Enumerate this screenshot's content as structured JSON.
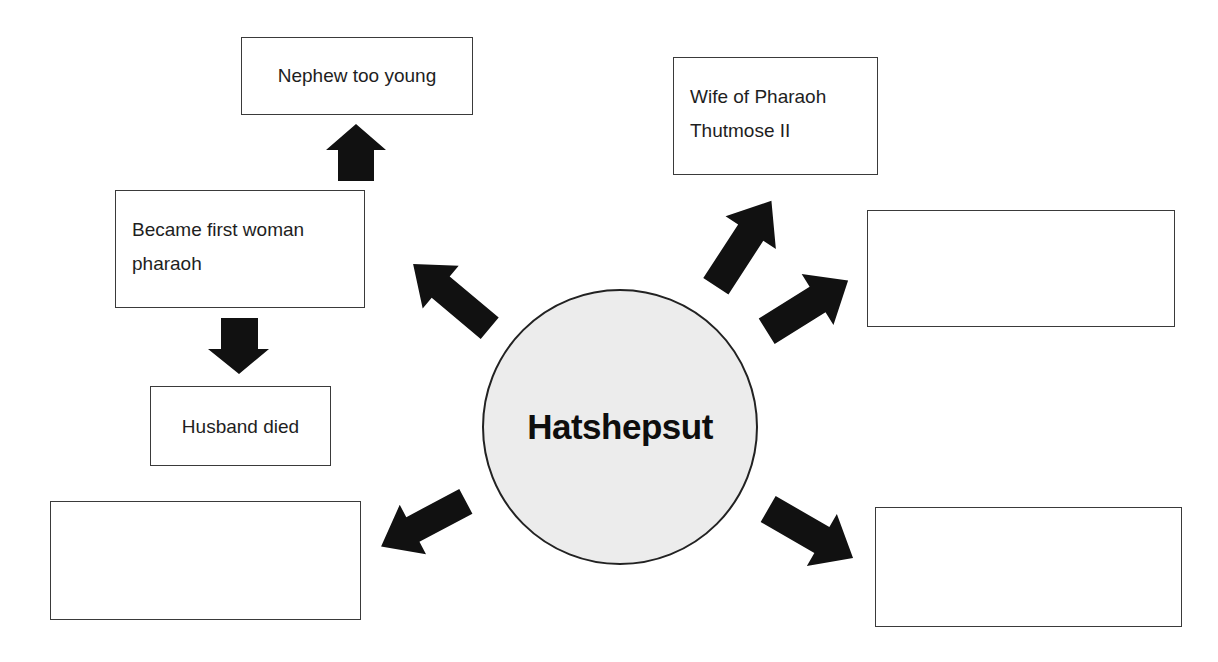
{
  "diagram": {
    "type": "concept-web",
    "center": {
      "label": "Hatshepsut"
    },
    "boxes": [
      {
        "id": "nephew",
        "text": "Nephew too young"
      },
      {
        "id": "first-woman",
        "text": "Became first woman\npharaoh"
      },
      {
        "id": "husband",
        "text": "Husband died"
      },
      {
        "id": "bottom-left",
        "text": ""
      },
      {
        "id": "wife",
        "text": "Wife of Pharaoh\nThutmose II"
      },
      {
        "id": "right",
        "text": ""
      },
      {
        "id": "bottom-right",
        "text": ""
      }
    ],
    "arrows": [
      {
        "from": "center",
        "to": "first-woman",
        "icon": "arrow-up-left-icon"
      },
      {
        "from": "first-woman",
        "to": "nephew",
        "icon": "arrow-up-icon"
      },
      {
        "from": "first-woman",
        "to": "husband",
        "icon": "arrow-down-icon"
      },
      {
        "from": "center",
        "to": "bottom-left",
        "icon": "arrow-down-left-icon"
      },
      {
        "from": "center",
        "to": "wife",
        "icon": "arrow-up-right-icon"
      },
      {
        "from": "center",
        "to": "right",
        "icon": "arrow-up-right-icon"
      },
      {
        "from": "center",
        "to": "bottom-right",
        "icon": "arrow-down-right-icon"
      }
    ],
    "colors": {
      "arrow": "#111111",
      "circle_fill": "#ececec",
      "border": "#3a3a3a"
    }
  }
}
